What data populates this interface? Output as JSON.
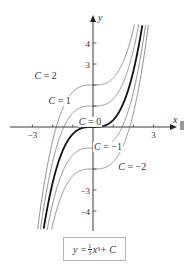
{
  "chart_data": {
    "type": "line",
    "title": "",
    "function": "y = (1/3) x^3 + C",
    "xlabel": "x",
    "ylabel": "y",
    "xlim": [
      -3.6,
      4.2
    ],
    "ylim": [
      -4.9,
      4.9
    ],
    "grid": false,
    "x_ticks": [
      -3,
      -2,
      -1,
      1,
      2,
      3
    ],
    "x_tick_labels": [
      {
        "value": -3,
        "label": "−3"
      },
      {
        "value": 3,
        "label": "3"
      }
    ],
    "y_ticks": [
      -4,
      -3,
      -2,
      -1,
      1,
      2,
      3,
      4
    ],
    "y_tick_labels": [
      {
        "value": 4,
        "label": "4"
      },
      {
        "value": 3,
        "label": "3"
      },
      {
        "value": -3,
        "label": "−3"
      },
      {
        "value": -4,
        "label": "−4"
      }
    ],
    "series": [
      {
        "name": "C = 2",
        "C": 2,
        "highlight": false,
        "label_pos": [
          -2.9,
          2.3
        ]
      },
      {
        "name": "C = 1",
        "C": 1,
        "highlight": false,
        "label_pos": [
          -2.2,
          1.1
        ]
      },
      {
        "name": "C = 0",
        "C": 0,
        "highlight": true,
        "label_pos": [
          -0.7,
          0.1
        ]
      },
      {
        "name": "C = −1",
        "C": -1,
        "highlight": false,
        "label_pos": [
          0.05,
          -1.1
        ]
      },
      {
        "name": "C = −2",
        "C": -2,
        "highlight": false,
        "label_pos": [
          1.25,
          -2.05
        ]
      }
    ],
    "legend": "none",
    "annotation": "y = ⅓x³ + C"
  },
  "labels": {
    "x_axis": "x",
    "y_axis": "y",
    "formula": {
      "lhs": "y = ",
      "num": "1",
      "den": "3",
      "var": "x",
      "exp": "3",
      "rhs": " + C"
    }
  }
}
